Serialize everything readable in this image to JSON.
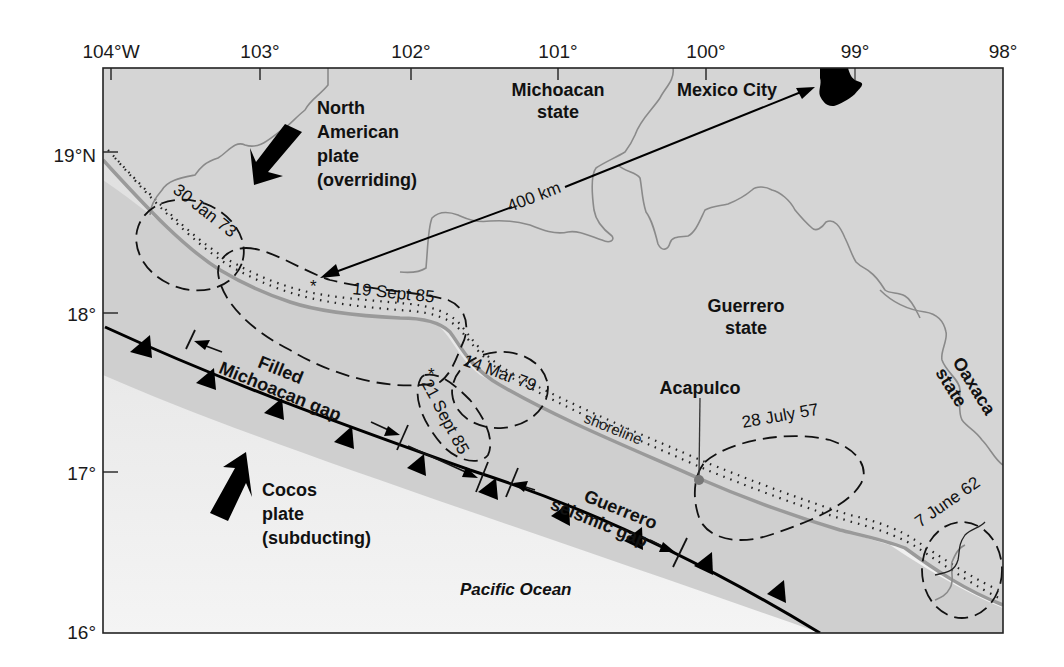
{
  "map": {
    "title": "Michoacan and Guerrero seismic gaps, Mexico subduction zone",
    "colors": {
      "land": "#d4d4d4",
      "coastal_sea": "#c6c6c6",
      "ocean": "#eeeeee",
      "border": "#8a8a8a",
      "ink": "#111111"
    },
    "axes": {
      "longitude_ticks": [
        "104°W",
        "103°",
        "102°",
        "101°",
        "100°",
        "99°",
        "98°"
      ],
      "latitude_ticks": [
        "19°N",
        "18°",
        "17°",
        "16°"
      ]
    },
    "regions": {
      "michoacan": [
        "Michoacan",
        "state"
      ],
      "mexico_city": "Mexico City",
      "guerrero": [
        "Guerrero",
        "state"
      ],
      "oaxaca": [
        "Oaxaca",
        "state"
      ],
      "pacific": "Pacific Ocean"
    },
    "plates": {
      "north_american": [
        "North",
        "American",
        "plate",
        "(overriding)"
      ],
      "cocos": [
        "Cocos",
        "plate",
        "(subducting)"
      ]
    },
    "distance_label": "400 km",
    "places": {
      "acapulco": "Acapulco",
      "shoreline": "shoreline"
    },
    "gaps": {
      "michoacan": [
        "Filled",
        "Michoacan gap"
      ],
      "guerrero": [
        "Guerrero",
        "seismic gap"
      ]
    },
    "earthquakes": [
      {
        "label": "30 Jan 73"
      },
      {
        "label": "19 Sept 85"
      },
      {
        "label": "21 Sept 85"
      },
      {
        "label": "14 Mar 79"
      },
      {
        "label": "28 July 57"
      },
      {
        "label": "7 June 62"
      }
    ]
  }
}
